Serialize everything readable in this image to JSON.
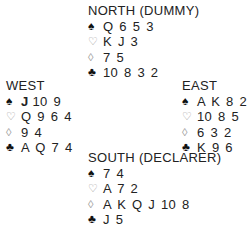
{
  "hands": {
    "north": {
      "title": "NORTH (DUMMY)",
      "spades": "Q 6 5 3",
      "hearts": "K J 3",
      "diamonds": "7 5",
      "clubs": "10 8 3 2"
    },
    "west": {
      "title": "WEST",
      "spades_bold": "J",
      "spades": "10 9",
      "hearts": "Q 9 6 4",
      "diamonds": "9 4",
      "clubs": "A Q 7 4"
    },
    "east": {
      "title": "EAST",
      "spades": "A K 8 2",
      "hearts": "10 8 5",
      "diamonds": "6 3 2",
      "clubs": "K 9 6"
    },
    "south": {
      "title": "SOUTH (DECLARER)",
      "spades": "7 4",
      "hearts": "A 7 2",
      "diamonds": "A K Q J 10 8",
      "clubs": "J 5"
    }
  },
  "icons": {
    "spade": "♠",
    "heart": "♡",
    "diamond": "◊",
    "club": "♣"
  }
}
